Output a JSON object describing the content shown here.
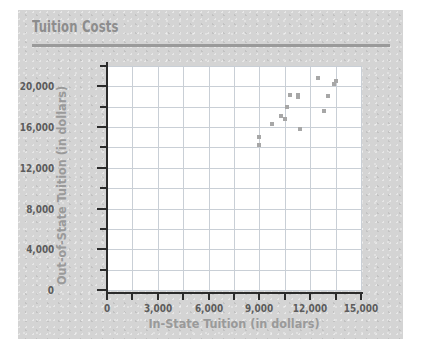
{
  "card": {
    "title": "Tuition Costs",
    "bg_color": "#d4d4d4",
    "title_color": "#8d8d8d",
    "rule_color": "#9a9a9a"
  },
  "chart_data": {
    "type": "scatter",
    "title": "Tuition Costs",
    "xlabel": "In-State Tuition (in dollars)",
    "ylabel": "Out-of-State Tuition (in dollars)",
    "xlim": [
      0,
      15000
    ],
    "ylim": [
      0,
      22000
    ],
    "xticks": [
      0,
      3000,
      6000,
      9000,
      12000,
      15000
    ],
    "xtick_labels": [
      "0",
      "3,000",
      "6,000",
      "9,000",
      "12,000",
      "15,000"
    ],
    "yticks": [
      0,
      4000,
      8000,
      12000,
      16000,
      20000
    ],
    "ytick_labels": [
      "0",
      "4,000",
      "8,000",
      "12,000",
      "16,000",
      "20,000"
    ],
    "y_minor_step": 2000,
    "x_grid_step": 1500,
    "y_grid_step": 2000,
    "grid": true,
    "grid_color": "#c9cfd6",
    "legend": null,
    "marker_color": "#a7a7a7",
    "points": [
      {
        "x": 9000,
        "y": 15000
      },
      {
        "x": 9000,
        "y": 14200
      },
      {
        "x": 9750,
        "y": 16300
      },
      {
        "x": 10300,
        "y": 17100
      },
      {
        "x": 10500,
        "y": 16800
      },
      {
        "x": 10650,
        "y": 18000
      },
      {
        "x": 10800,
        "y": 19200
      },
      {
        "x": 11250,
        "y": 19200
      },
      {
        "x": 11300,
        "y": 19000
      },
      {
        "x": 11400,
        "y": 15800
      },
      {
        "x": 12450,
        "y": 20800
      },
      {
        "x": 12800,
        "y": 17600
      },
      {
        "x": 13050,
        "y": 19100
      },
      {
        "x": 13400,
        "y": 20200
      },
      {
        "x": 13500,
        "y": 20500
      }
    ]
  }
}
